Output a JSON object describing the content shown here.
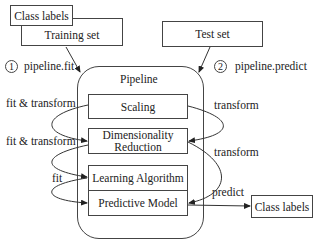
{
  "inputs": {
    "class_labels_top": "Class labels",
    "training_set": "Training set",
    "test_set": "Test set"
  },
  "steps": {
    "step1_number": "1",
    "step1_label": "pipeline.fit",
    "step2_number": "2",
    "step2_label": "pipeline.predict"
  },
  "pipeline": {
    "title": "Pipeline",
    "stages": {
      "scaling": "Scaling",
      "dim_reduction_line1": "Dimensionality",
      "dim_reduction_line2": "Reduction",
      "learning_algorithm": "Learning Algorithm",
      "predictive_model": "Predictive Model"
    }
  },
  "edges": {
    "left_1": "fit & transform",
    "left_2": "fit & transform",
    "left_3": "fit",
    "right_1": "transform",
    "right_2": "transform",
    "predict": "predict"
  },
  "output": {
    "class_labels_bottom": "Class labels"
  }
}
